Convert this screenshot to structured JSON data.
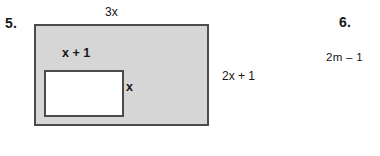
{
  "page": {
    "background_color": "#ffffff",
    "width": 380,
    "height": 156
  },
  "problems": [
    {
      "number_label": "5.",
      "figure": {
        "type": "shaded-rectangle-with-cutout",
        "outer": {
          "name": "outer-rectangle",
          "fill_color": "#d6d6d6",
          "border_color": "#4b4b4b",
          "width_label": "3x",
          "height_label": "2x + 1"
        },
        "inner": {
          "name": "inner-rectangle",
          "fill_color": "#ffffff",
          "border_color": "#4b4b4b",
          "width_label": "x + 1",
          "height_label": "x"
        }
      }
    },
    {
      "number_label": "6.",
      "expression": "2m – 1"
    }
  ]
}
